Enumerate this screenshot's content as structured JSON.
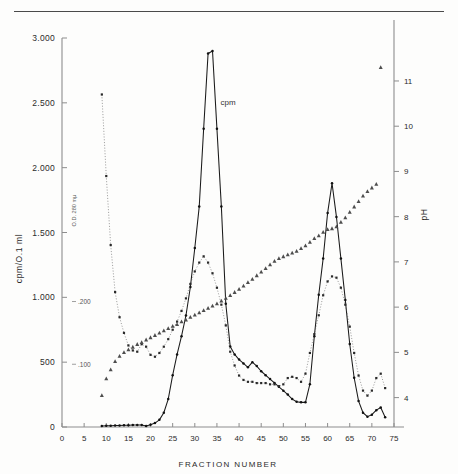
{
  "figure": {
    "background_color": "#fdfdfc",
    "ink_color": "#1a1a1a"
  },
  "chart_data": {
    "type": "line",
    "title": "",
    "xlabel": "FRACTION NUMBER",
    "ylabel": "cpm/O.1 ml",
    "xlim": [
      0,
      75
    ],
    "ylim": [
      0,
      3000
    ],
    "grid": false,
    "legend_position": "inline-annotations",
    "x_ticks": [
      0,
      5,
      10,
      15,
      20,
      25,
      30,
      35,
      40,
      45,
      50,
      55,
      60,
      65,
      70,
      75
    ],
    "y_ticks": [
      0,
      500,
      1000,
      1500,
      2000,
      2500,
      3000
    ],
    "y_tick_labels": [
      "0",
      "500",
      "1.000",
      "1.500",
      "2.000",
      "2.500",
      "3.000"
    ],
    "secondary_axes": [
      {
        "name": "pH",
        "label": "pH",
        "side": "right",
        "ticks": [
          4,
          5,
          6,
          7,
          8,
          9,
          10,
          11
        ],
        "lim": [
          3.35,
          11.95
        ]
      },
      {
        "name": "O.D. 280 mu",
        "label": "O.D. 280 mμ",
        "side": "left-inner",
        "ticks": [
          0.1,
          0.2
        ],
        "tick_labels": [
          ".100",
          ".200"
        ],
        "lim": [
          0,
          0.62
        ]
      }
    ],
    "annotations": [
      {
        "text": "cpm",
        "x": 37.5,
        "y": 2480,
        "series": "cpm"
      },
      {
        "text": "O.D.",
        "x": 36.5,
        "y": 168,
        "series": "od"
      },
      {
        "text": "pH",
        "x": 42.2,
        "y": 1630,
        "series": "ph"
      }
    ],
    "series": [
      {
        "name": "cpm",
        "label": "cpm",
        "axis": "left",
        "style": "solid-line-with-dots",
        "marker": "dot",
        "x": [
          9,
          10,
          11,
          12,
          13,
          14,
          15,
          16,
          17,
          18,
          19,
          20,
          21,
          22,
          23,
          24,
          25,
          26,
          27,
          28,
          29,
          30,
          31,
          32,
          33,
          34,
          35,
          36,
          37,
          38,
          39,
          40,
          41,
          42,
          43,
          44,
          45,
          46,
          47,
          48,
          49,
          50,
          51,
          52,
          53,
          54,
          55,
          56,
          57,
          58,
          59,
          60,
          61,
          62,
          63,
          64,
          65,
          66,
          67,
          68,
          69,
          70,
          71,
          72,
          73
        ],
        "values": [
          8,
          10,
          10,
          12,
          12,
          14,
          14,
          15,
          16,
          16,
          8,
          18,
          30,
          55,
          110,
          215,
          400,
          560,
          700,
          860,
          1080,
          1380,
          1700,
          2300,
          2880,
          2900,
          2300,
          1700,
          950,
          620,
          560,
          520,
          490,
          460,
          500,
          470,
          430,
          400,
          370,
          340,
          310,
          280,
          250,
          215,
          195,
          190,
          190,
          330,
          700,
          1020,
          1300,
          1650,
          1880,
          1620,
          1300,
          980,
          640,
          380,
          200,
          110,
          80,
          95,
          130,
          150,
          75
        ]
      },
      {
        "name": "od",
        "label": "O.D.",
        "axis": "od",
        "style": "dotted-line-with-dots",
        "marker": "dot",
        "x": [
          9,
          10,
          11,
          12,
          13,
          14,
          15,
          16,
          17,
          18,
          19,
          20,
          21,
          22,
          23,
          24,
          25,
          26,
          27,
          28,
          29,
          30,
          31,
          32,
          33,
          34,
          35,
          36,
          37,
          38,
          39,
          40,
          41,
          42,
          43,
          44,
          45,
          46,
          47,
          48,
          49,
          50,
          51,
          52,
          53,
          54,
          55,
          56,
          57,
          58,
          59,
          60,
          61,
          62,
          63,
          64,
          65,
          66,
          67,
          68,
          69,
          70,
          71,
          72,
          73
        ],
        "values": [
          0.53,
          0.4,
          0.29,
          0.215,
          0.175,
          0.15,
          0.13,
          0.122,
          0.12,
          0.132,
          0.128,
          0.115,
          0.112,
          0.118,
          0.128,
          0.14,
          0.155,
          0.168,
          0.185,
          0.205,
          0.228,
          0.248,
          0.262,
          0.272,
          0.262,
          0.245,
          0.222,
          0.195,
          0.162,
          0.12,
          0.098,
          0.082,
          0.075,
          0.072,
          0.072,
          0.07,
          0.07,
          0.07,
          0.068,
          0.068,
          0.065,
          0.068,
          0.078,
          0.08,
          0.078,
          0.072,
          0.085,
          0.118,
          0.148,
          0.178,
          0.21,
          0.232,
          0.24,
          0.238,
          0.222,
          0.195,
          0.16,
          0.118,
          0.082,
          0.058,
          0.05,
          0.058,
          0.078,
          0.085,
          0.062
        ]
      },
      {
        "name": "ph",
        "label": "pH",
        "axis": "ph",
        "style": "markers-only",
        "marker": "triangle",
        "x": [
          9,
          10,
          11,
          12,
          13,
          14,
          15,
          16,
          17,
          18,
          19,
          20,
          21,
          22,
          23,
          24,
          25,
          26,
          27,
          28,
          29,
          30,
          31,
          32,
          33,
          34,
          35,
          36,
          37,
          38,
          39,
          40,
          41,
          42,
          43,
          44,
          45,
          46,
          47,
          48,
          49,
          50,
          51,
          52,
          53,
          54,
          55,
          56,
          57,
          58,
          59,
          60,
          61,
          62,
          63,
          64,
          65,
          66,
          67,
          68,
          69,
          70,
          71,
          72
        ],
        "values": [
          4.05,
          4.42,
          4.62,
          4.8,
          4.92,
          5.0,
          5.06,
          5.12,
          5.18,
          5.22,
          5.28,
          5.33,
          5.38,
          5.43,
          5.48,
          5.53,
          5.58,
          5.62,
          5.68,
          5.72,
          5.78,
          5.83,
          5.88,
          5.93,
          5.98,
          6.03,
          6.08,
          6.14,
          6.2,
          6.26,
          6.33,
          6.4,
          6.47,
          6.55,
          6.62,
          6.7,
          6.78,
          6.86,
          6.94,
          7.02,
          7.08,
          7.12,
          7.16,
          7.2,
          7.24,
          7.3,
          7.36,
          7.44,
          7.52,
          7.58,
          7.66,
          7.72,
          7.74,
          7.78,
          7.88,
          7.98,
          8.1,
          8.22,
          8.34,
          8.46,
          8.56,
          8.64,
          8.72,
          11.3
        ]
      }
    ]
  }
}
